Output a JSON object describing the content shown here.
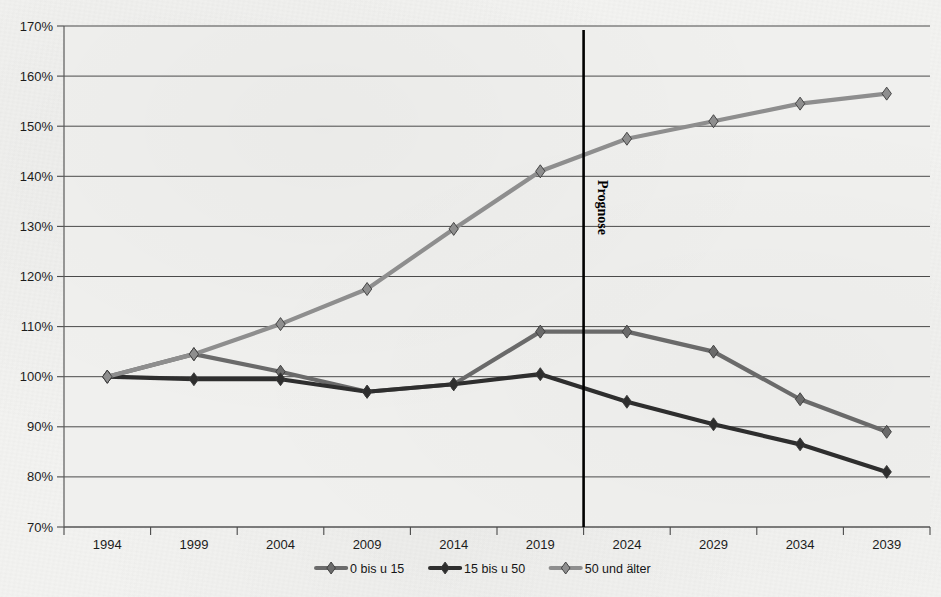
{
  "chart_data": {
    "type": "line",
    "title": "",
    "subtitle": "",
    "xlabel": "",
    "ylabel": "",
    "x": [
      "1994",
      "1999",
      "2004",
      "2009",
      "2014",
      "2019",
      "2024",
      "2029",
      "2034",
      "2039"
    ],
    "categories": [
      "1994",
      "1999",
      "2004",
      "2009",
      "2014",
      "2019",
      "2024",
      "2029",
      "2034",
      "2039"
    ],
    "ylim": [
      70,
      170
    ],
    "ytick_step": 10,
    "ytick_labels": [
      "170%",
      "160%",
      "150%",
      "140%",
      "130%",
      "120%",
      "110%",
      "100%",
      "90%",
      "80%",
      "70%"
    ],
    "ytick_values": [
      170,
      160,
      150,
      140,
      130,
      120,
      110,
      100,
      90,
      80,
      70
    ],
    "grid": true,
    "grid_axis": "y",
    "legend_position": "bottom",
    "value_unit": "%",
    "series": [
      {
        "name": "0 bis u 15",
        "color": "#6b6b6b",
        "values": [
          100.0,
          104.5,
          101.0,
          97.0,
          98.5,
          109.0,
          109.0,
          105.0,
          95.5,
          89.0
        ]
      },
      {
        "name": "15 bis u 50",
        "color": "#2e2e2e",
        "values": [
          100.0,
          99.5,
          99.5,
          97.0,
          98.5,
          100.5,
          95.0,
          90.5,
          86.5,
          81.0
        ]
      },
      {
        "name": "50 und älter",
        "color": "#8e8e8e",
        "values": [
          100.0,
          104.5,
          110.5,
          117.5,
          129.5,
          141.0,
          147.5,
          151.0,
          154.5,
          156.5
        ]
      }
    ],
    "annotations": [
      {
        "name": "forecast-divider",
        "text": "Prognose",
        "orientation": "vertical",
        "x_between": [
          "2019",
          "2024"
        ],
        "color": "#000000"
      }
    ]
  },
  "legend": {
    "items": [
      {
        "label": "0 bis u 15",
        "color": "#6b6b6b"
      },
      {
        "label": "15 bis u 50",
        "color": "#2e2e2e"
      },
      {
        "label": "50 und älter",
        "color": "#8e8e8e"
      }
    ]
  }
}
